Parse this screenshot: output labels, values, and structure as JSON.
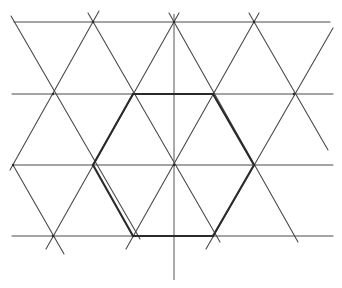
{
  "diagram": {
    "title": "",
    "type": "triangular-lattice-with-hexagon",
    "colors": {
      "background": "#ffffff",
      "line": "#4a4a4a",
      "hexagon": "#2a2a2a"
    },
    "horizontal_lines": [
      {
        "x1": 14,
        "y1": 22,
        "x2": 330,
        "y2": 22
      },
      {
        "x1": 12,
        "y1": 94,
        "x2": 333,
        "y2": 94
      },
      {
        "x1": 13,
        "y1": 165,
        "x2": 333,
        "y2": 165
      },
      {
        "x1": 12,
        "y1": 236,
        "x2": 333,
        "y2": 236
      }
    ],
    "diagonal_lines": [
      {
        "x1": 11,
        "y1": 16,
        "x2": 140,
        "y2": 239
      },
      {
        "x1": 88,
        "y1": 13,
        "x2": 220,
        "y2": 242
      },
      {
        "x1": 169,
        "y1": 13,
        "x2": 298,
        "y2": 242
      },
      {
        "x1": 249,
        "y1": 13,
        "x2": 328,
        "y2": 150
      },
      {
        "x1": 13,
        "y1": 165,
        "x2": 64,
        "y2": 254
      },
      {
        "x1": 99,
        "y1": 11,
        "x2": 10,
        "y2": 170
      },
      {
        "x1": 179,
        "y1": 13,
        "x2": 46,
        "y2": 249
      },
      {
        "x1": 259,
        "y1": 13,
        "x2": 126,
        "y2": 249
      },
      {
        "x1": 333,
        "y1": 28,
        "x2": 206,
        "y2": 249
      }
    ],
    "vertical_axis": {
      "x1": 174,
      "y1": 14,
      "x2": 174,
      "y2": 280
    },
    "hexagon": {
      "points": "133,94 213,94 254,165 213,236 133,236 93,165"
    },
    "vertices": [
      {
        "x": 93,
        "y": 22
      },
      {
        "x": 174,
        "y": 22
      },
      {
        "x": 254,
        "y": 22
      },
      {
        "x": 53,
        "y": 94
      },
      {
        "x": 133,
        "y": 94
      },
      {
        "x": 213,
        "y": 94
      },
      {
        "x": 294,
        "y": 94
      },
      {
        "x": 13,
        "y": 165
      },
      {
        "x": 93,
        "y": 165
      },
      {
        "x": 174,
        "y": 165
      },
      {
        "x": 254,
        "y": 165
      },
      {
        "x": 53,
        "y": 236
      },
      {
        "x": 133,
        "y": 236
      },
      {
        "x": 213,
        "y": 236
      }
    ]
  }
}
